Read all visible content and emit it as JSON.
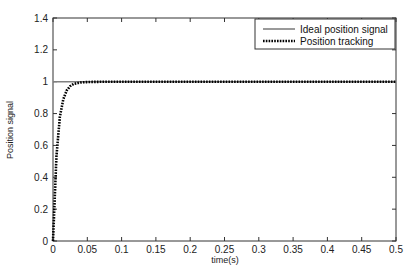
{
  "chart_data": {
    "type": "line",
    "title": "",
    "xlabel": "time(s)",
    "ylabel": "Position signal",
    "xlim": [
      0,
      0.5
    ],
    "ylim": [
      0,
      1.4
    ],
    "xticks": [
      0,
      0.05,
      0.1,
      0.15,
      0.2,
      0.25,
      0.3,
      0.35,
      0.4,
      0.45,
      0.5
    ],
    "xtick_labels": [
      "0",
      "0.05",
      "0.1",
      "0.15",
      "0.2",
      "0.25",
      "0.3",
      "0.35",
      "0.4",
      "0.45",
      "0.5"
    ],
    "yticks": [
      0,
      0.2,
      0.4,
      0.6,
      0.8,
      1,
      1.2,
      1.4
    ],
    "ytick_labels": [
      "0",
      "0.2",
      "0.4",
      "0.6",
      "0.8",
      "1",
      "1.2",
      "1.4"
    ],
    "grid": false,
    "legend_position": "upper right",
    "series": [
      {
        "name": "Ideal position signal",
        "style": "solid",
        "color": "#808080",
        "x": [
          0,
          0.5
        ],
        "y": [
          1,
          1
        ]
      },
      {
        "name": "Position tracking",
        "style": "dotted",
        "color": "#000000",
        "x": [
          0,
          0.005,
          0.01,
          0.015,
          0.02,
          0.025,
          0.03,
          0.04,
          0.05,
          0.06,
          0.08,
          0.1,
          0.15,
          0.2,
          0.3,
          0.4,
          0.5
        ],
        "y": [
          0,
          0.53,
          0.78,
          0.89,
          0.945,
          0.972,
          0.986,
          0.995,
          0.998,
          0.999,
          1.0,
          1.0,
          1.0,
          1.0,
          1.0,
          1.0,
          1.0
        ]
      }
    ]
  }
}
